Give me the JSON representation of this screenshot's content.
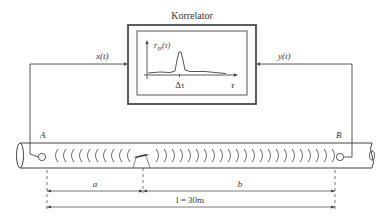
{
  "correlator": {
    "title": "Korrelator",
    "ylabel": "r_xy(τ)",
    "ylabel_main": "r",
    "ylabel_sub": "xy",
    "ylabel_arg": "(τ)",
    "peak_label": "Δτ",
    "xaxis_label": "τ"
  },
  "signals": {
    "left": "x(t)",
    "right": "y(t)"
  },
  "sensors": {
    "left": "A",
    "right": "B"
  },
  "dimensions": {
    "a": "a",
    "b": "b",
    "total": "l = 30m"
  },
  "colors": {
    "line": "#444444",
    "background": "#ffffff"
  }
}
